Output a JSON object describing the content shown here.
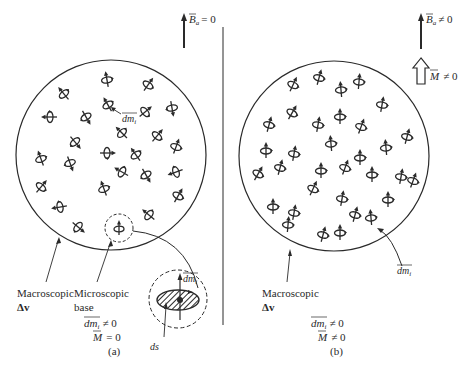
{
  "figure": {
    "colors": {
      "ink": "#2a2a2a",
      "background": "#ffffff"
    }
  },
  "panel_a": {
    "caption": "(a)",
    "field_label_B": "B",
    "field_label_sub": "a",
    "field_label_rel": "= 0",
    "dipole_label": "dm",
    "dipole_label_sub": "i",
    "macroscopic_label_line1": "Macroscopic",
    "macroscopic_label_line2": "Δv",
    "microscopic_label_line1": "Microscopic",
    "microscopic_label_line2": "base",
    "inset_dipole_label": "dm",
    "inset_dipole_label_sub": "i",
    "inset_area_label": "ds",
    "eq1_lhs": "dm",
    "eq1_sub": "i",
    "eq1_rel": "≠ 0",
    "eq2_lhs": "M",
    "eq2_rel": "= 0"
  },
  "panel_b": {
    "caption": "(b)",
    "field_label_B": "B",
    "field_label_sub": "a",
    "field_label_rel": "≠ 0",
    "magnetization_label": "M",
    "magnetization_rel": "≠ 0",
    "dipole_label": "dm",
    "dipole_label_sub": "i",
    "macroscopic_label_line1": "Macroscopic",
    "macroscopic_label_line2": "Δv",
    "eq1_lhs": "dm",
    "eq1_sub": "i",
    "eq1_rel": "≠ 0",
    "eq2_lhs": "M",
    "eq2_rel": "≠ 0"
  }
}
